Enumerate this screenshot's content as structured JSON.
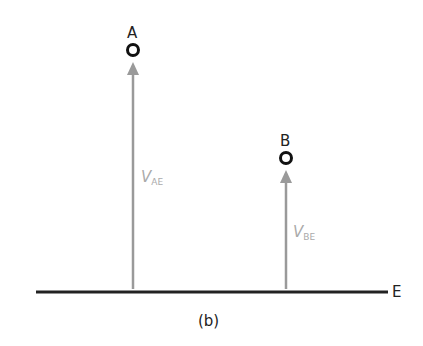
{
  "diagram": {
    "points": [
      {
        "id": "A",
        "label": "A",
        "velocity_label": "V",
        "velocity_subscript": "AE"
      },
      {
        "id": "B",
        "label": "B",
        "velocity_label": "V",
        "velocity_subscript": "BE"
      }
    ],
    "ground_label": "E",
    "caption": "(b)",
    "colors": {
      "ground": "#222222",
      "arrow": "#9a9a9a",
      "point": "#111111",
      "velocity_text": "#aaaaaa"
    }
  }
}
